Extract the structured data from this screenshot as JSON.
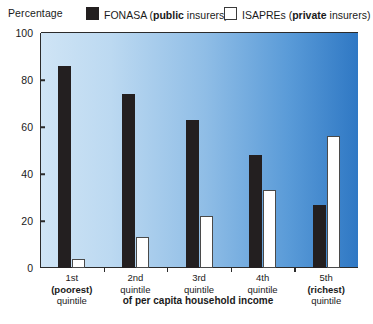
{
  "chart": {
    "yaxis_title": "Percentage",
    "xaxis_caption": "of per capita household income"
  },
  "legend": {
    "items": [
      {
        "name": "FONASA",
        "emph": "public",
        "suffix": " insurers)",
        "prefix": " (",
        "swatch": "black-swatch"
      },
      {
        "name": "ISAPREs",
        "emph": "private",
        "suffix": " insurers)",
        "prefix": " (",
        "swatch": "white-swatch"
      }
    ]
  },
  "chart_data": {
    "type": "bar",
    "title": "",
    "xlabel": "of per capita household income",
    "ylabel": "Percentage",
    "ylim": [
      0,
      100
    ],
    "yticks": [
      0,
      20,
      40,
      60,
      80,
      100
    ],
    "grid": false,
    "legend_position": "top",
    "categories": [
      "1st (poorest) quintile",
      "2nd quintile",
      "3rd quintile",
      "4th quintile",
      "5th (richest) quintile"
    ],
    "category_lines": [
      {
        "l1": "1st",
        "l2": "(poorest)",
        "l3": "quintile",
        "bold_line": 2
      },
      {
        "l1": "2nd",
        "l2": "quintile",
        "l3": "",
        "bold_line": 0
      },
      {
        "l1": "3rd",
        "l2": "quintile",
        "l3": "",
        "bold_line": 0
      },
      {
        "l1": "4th",
        "l2": "quintile",
        "l3": "",
        "bold_line": 0
      },
      {
        "l1": "5th",
        "l2": "(richest)",
        "l3": "quintile",
        "bold_line": 2
      }
    ],
    "series": [
      {
        "name": "FONASA (public insurers)",
        "color": "#231f20",
        "values": [
          86,
          74,
          63,
          48,
          27
        ]
      },
      {
        "name": "ISAPREs (private insurers)",
        "color": "#ffffff",
        "values": [
          4,
          13,
          22,
          33,
          56
        ]
      }
    ]
  },
  "colors": {
    "bar_dark": "#231f20",
    "bar_light": "#ffffff",
    "axis": "#2b2b2b",
    "bg_gradient_start": "#cfe4f5",
    "bg_gradient_end": "#2f78c4"
  }
}
